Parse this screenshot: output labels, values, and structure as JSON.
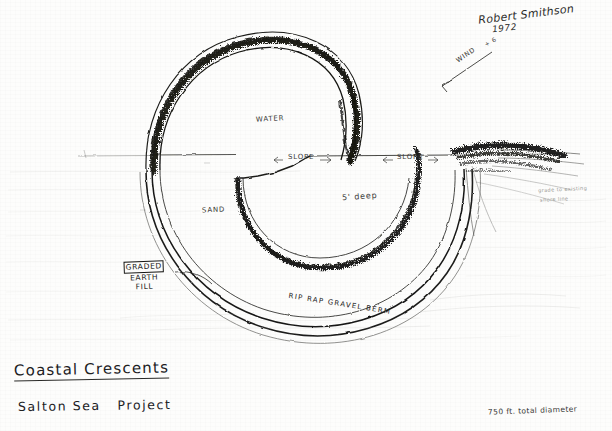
{
  "artwork": {
    "medium_note": "pencil and ink drawing on paper",
    "background_color": "#fdfdfc",
    "ink_color": "#1a1a18"
  },
  "signature": {
    "name": "Robert Smithson",
    "year": "1972"
  },
  "title_block": {
    "title": "Coastal Crescents",
    "subtitle": "Salton Sea   Project",
    "dimension_note": "750 ft. total diameter"
  },
  "annotations": {
    "wind": "WIND",
    "wind_mark": "+ 6",
    "water": "WATER",
    "sand": "SAND",
    "depth": "5' deep",
    "slope_left": "SLOPE",
    "slope_right": "SLOPE",
    "slope_left_arrow_in": "<",
    "slope_left_arrow_out": "—)",
    "slope_right_arrow_in": "(—",
    "slope_right_arrow_out": "—",
    "fill_label": {
      "line1": "GRADED",
      "line2": "EARTH",
      "line3": "FILL"
    },
    "berm": "RIP RAP  GRAVEL  BERM",
    "faint_right_1": "grade to existing",
    "faint_right_2": "shore line"
  },
  "icons": {
    "wind_arrow": "wind-arrow-icon",
    "slope_arrow_left": "slope-arrow-left-icon",
    "slope_arrow_right": "slope-arrow-right-icon",
    "underline_rule": "underline-rule-icon"
  }
}
